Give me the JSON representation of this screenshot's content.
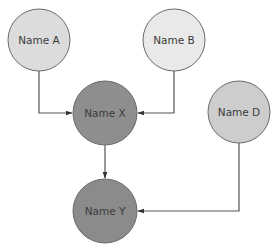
{
  "diagram": {
    "type": "directed-graph",
    "nodes": [
      {
        "id": "A",
        "label": "Name A",
        "cx": 39,
        "cy": 40,
        "r": 31,
        "fill": "#dcdcdc"
      },
      {
        "id": "B",
        "label": "Name B",
        "cx": 174,
        "cy": 40,
        "r": 31,
        "fill": "#e9e9e9"
      },
      {
        "id": "X",
        "label": "Name X",
        "cx": 105,
        "cy": 113,
        "r": 32,
        "fill": "#8e8e8e"
      },
      {
        "id": "D",
        "label": "Name D",
        "cx": 239,
        "cy": 112,
        "r": 31,
        "fill": "#cdcdcd"
      },
      {
        "id": "Y",
        "label": "Name Y",
        "cx": 105,
        "cy": 211,
        "r": 32,
        "fill": "#8b8b8b"
      }
    ],
    "edges": [
      {
        "from": "A",
        "to": "X",
        "points": [
          [
            39,
            71
          ],
          [
            39,
            113
          ],
          [
            72,
            113
          ]
        ]
      },
      {
        "from": "B",
        "to": "X",
        "points": [
          [
            174,
            71
          ],
          [
            174,
            113
          ],
          [
            138,
            113
          ]
        ]
      },
      {
        "from": "X",
        "to": "Y",
        "points": [
          [
            105,
            145
          ],
          [
            105,
            178
          ]
        ]
      },
      {
        "from": "D",
        "to": "Y",
        "points": [
          [
            239,
            143
          ],
          [
            239,
            211
          ],
          [
            138,
            211
          ]
        ]
      }
    ],
    "stroke": "#555555",
    "node_stroke": "#6a6a6a"
  }
}
